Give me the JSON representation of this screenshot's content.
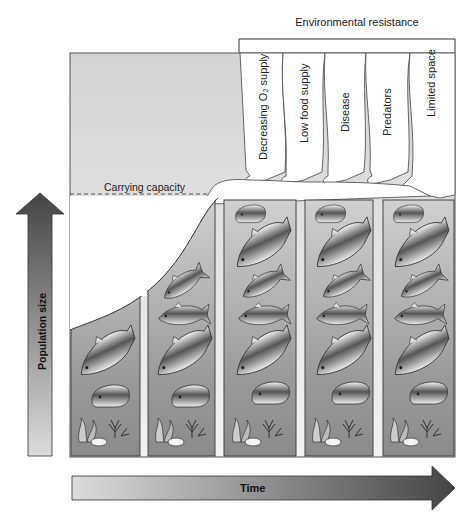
{
  "diagram": {
    "title": "Environmental resistance",
    "carrying_capacity_label": "Carrying capacity",
    "y_axis_label": "Population size",
    "x_axis_label": "Time",
    "resistance_factors": [
      {
        "label": "Decreasing O2 supply",
        "display": "Decreasing O₂ supply"
      },
      {
        "label": "Low food supply",
        "display": "Low food supply"
      },
      {
        "label": "Disease",
        "display": "Disease"
      },
      {
        "label": "Predators",
        "display": "Predators"
      },
      {
        "label": "Limited space",
        "display": "Limited space"
      }
    ],
    "panels": [
      {
        "index": 1,
        "fish_count": 2
      },
      {
        "index": 2,
        "fish_count": 4
      },
      {
        "index": 3,
        "fish_count": 6
      },
      {
        "index": 4,
        "fish_count": 6
      },
      {
        "index": 5,
        "fish_count": 6
      }
    ],
    "colors": {
      "frame_bg": "#d9d9d9",
      "panel_top": "#c8c8c8",
      "panel_bottom": "#8a8a8a",
      "arrow_dark": "#4a4a4a",
      "arrow_light": "#d8d8d8",
      "line": "#444444"
    }
  }
}
